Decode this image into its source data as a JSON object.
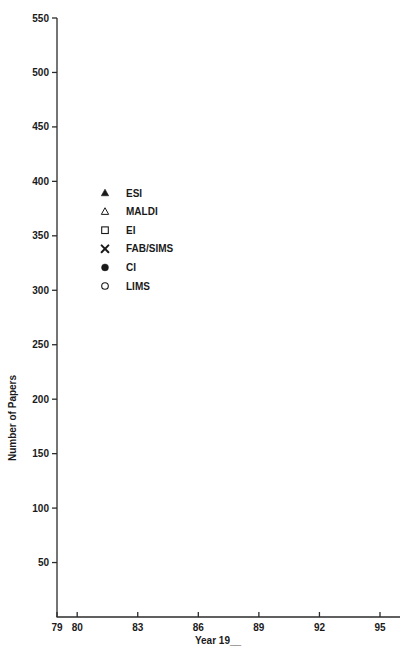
{
  "chart_data": {
    "type": "scatter",
    "title": "",
    "xlabel": "Year 19__",
    "ylabel": "Number of Papers",
    "xlim": [
      78.5,
      95.8
    ],
    "ylim": [
      0,
      550
    ],
    "xticks": [
      79,
      80,
      83,
      86,
      89,
      92,
      95
    ],
    "xtick_labels": [
      "79",
      "80",
      "83",
      "86",
      "89",
      "92",
      "95"
    ],
    "yticks": [
      50,
      100,
      150,
      200,
      250,
      300,
      350,
      400,
      450,
      500,
      550
    ],
    "ytick_labels": [
      "50",
      "100",
      "150",
      "200",
      "250",
      "300",
      "350",
      "400",
      "450",
      "500",
      "550"
    ],
    "grid": false,
    "legend_position": "upper-left-inside",
    "marker_color": "#1a1a1a",
    "series": [
      {
        "name": "ESI",
        "marker": "filled-triangle",
        "x": [
          1981,
          1982,
          1983,
          1984,
          1985,
          1986,
          1987,
          1988,
          1990,
          1991,
          1992,
          1994,
          1995
        ],
        "y": [
          4,
          4,
          4,
          5,
          6,
          6,
          9,
          13,
          45,
          122,
          200,
          290,
          362
        ]
      },
      {
        "name": "MALDI",
        "marker": "open-triangle",
        "x": [
          1988,
          1989,
          1990,
          1991,
          1992,
          1993,
          1994,
          1995
        ],
        "y": [
          2,
          3,
          24,
          60,
          70,
          108,
          115,
          185
        ]
      },
      {
        "name": "EI",
        "marker": "open-square",
        "x": [
          1979,
          1980,
          1981,
          1982,
          1983,
          1984,
          1985,
          1986,
          1987,
          1988,
          1989,
          1990,
          1991,
          1992,
          1994,
          1995
        ],
        "y": [
          268,
          271,
          224,
          246,
          232,
          183,
          180,
          196,
          210,
          250,
          258,
          300,
          300,
          301,
          334,
          374
        ]
      },
      {
        "name": "FAB/SIMS",
        "marker": "cross",
        "x": [
          1979,
          1980,
          1981,
          1982,
          1983,
          1984,
          1985,
          1986,
          1987,
          1988,
          1989,
          1990,
          1991,
          1992,
          1993,
          1994,
          1995
        ],
        "y": [
          10,
          8,
          37,
          70,
          105,
          107,
          120,
          145,
          137,
          220,
          193,
          193,
          193,
          205,
          185,
          120,
          111
        ]
      },
      {
        "name": "CI",
        "marker": "filled-circle",
        "x": [
          1979,
          1980,
          1981,
          1982,
          1983,
          1984,
          1985,
          1986,
          1987,
          1988,
          1989,
          1990,
          1991,
          1992,
          1993,
          1994,
          1995
        ],
        "y": [
          80,
          86,
          95,
          104,
          95,
          80,
          89,
          72,
          93,
          96,
          80,
          81,
          76,
          72,
          86,
          118,
          132
        ]
      },
      {
        "name": "LIMS",
        "marker": "open-circle",
        "x": [
          1979,
          1980,
          1981,
          1982,
          1983,
          1984,
          1985,
          1986,
          1987,
          1988,
          1989,
          1990,
          1991,
          1992,
          1993,
          1994,
          1995
        ],
        "y": [
          34,
          35,
          30,
          32,
          35,
          44,
          60,
          56,
          65,
          57,
          73,
          74,
          86,
          87,
          72,
          57,
          95
        ]
      }
    ],
    "legend": [
      {
        "label": "ESI",
        "marker": "filled-triangle"
      },
      {
        "label": "MALDI",
        "marker": "open-triangle"
      },
      {
        "label": "EI",
        "marker": "open-square"
      },
      {
        "label": "FAB/SIMS",
        "marker": "cross"
      },
      {
        "label": "CI",
        "marker": "filled-circle"
      },
      {
        "label": "LIMS",
        "marker": "open-circle"
      }
    ]
  }
}
